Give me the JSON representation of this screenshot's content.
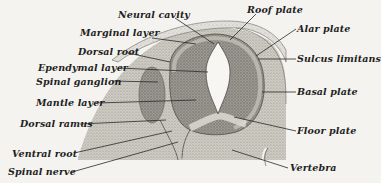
{
  "diagram": {
    "colors": {
      "background": "#f4f3ef",
      "tissue_light": "#d6d4cd",
      "tissue_mid": "#a9a69e",
      "tissue_dark": "#7d7a73",
      "cavity": "#f7f6f2",
      "ink": "#1f1f1f"
    },
    "labels_left": [
      {
        "id": "neural-cavity",
        "text": "Neural cavity"
      },
      {
        "id": "marginal-layer",
        "text": "Marginal layer"
      },
      {
        "id": "dorsal-root",
        "text": "Dorsal root"
      },
      {
        "id": "ependymal-layer",
        "text": "Ependymal layer"
      },
      {
        "id": "spinal-ganglion",
        "text": "Spinal ganglion"
      },
      {
        "id": "mantle-layer",
        "text": "Mantle layer"
      },
      {
        "id": "dorsal-ramus",
        "text": "Dorsal ramus"
      },
      {
        "id": "ventral-root",
        "text": "Ventral root"
      },
      {
        "id": "spinal-nerve",
        "text": "Spinal nerve"
      }
    ],
    "labels_right": [
      {
        "id": "roof-plate",
        "text": "Roof plate"
      },
      {
        "id": "alar-plate",
        "text": "Alar plate"
      },
      {
        "id": "sulcus-limitans",
        "text": "Sulcus limitans"
      },
      {
        "id": "basal-plate",
        "text": "Basal plate"
      },
      {
        "id": "floor-plate",
        "text": "Floor plate"
      },
      {
        "id": "vertebra",
        "text": "Vertebra"
      }
    ]
  }
}
